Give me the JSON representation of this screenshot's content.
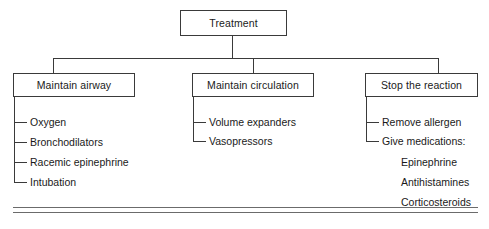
{
  "diagram": {
    "title": "Treatment",
    "root": {
      "label": "Treatment"
    },
    "branches": [
      {
        "label": "Maintain airway",
        "items": [
          {
            "label": "Oxygen"
          },
          {
            "label": "Bronchodilators"
          },
          {
            "label": "Racemic epinephrine"
          },
          {
            "label": "Intubation"
          }
        ],
        "subitems": []
      },
      {
        "label": "Maintain circulation",
        "items": [
          {
            "label": "Volume expanders"
          },
          {
            "label": "Vasopressors"
          }
        ],
        "subitems": []
      },
      {
        "label": "Stop the reaction",
        "items": [
          {
            "label": "Remove allergen"
          },
          {
            "label": "Give medications:"
          }
        ],
        "subitems": [
          {
            "label": "Epinephrine"
          },
          {
            "label": "Antihistamines"
          },
          {
            "label": "Corticosteroids"
          }
        ]
      }
    ],
    "colors": {
      "line": "#3a3a3a",
      "text": "#1a1a1a",
      "background": "#ffffff",
      "footer_rule": "#6b6b6b"
    }
  }
}
